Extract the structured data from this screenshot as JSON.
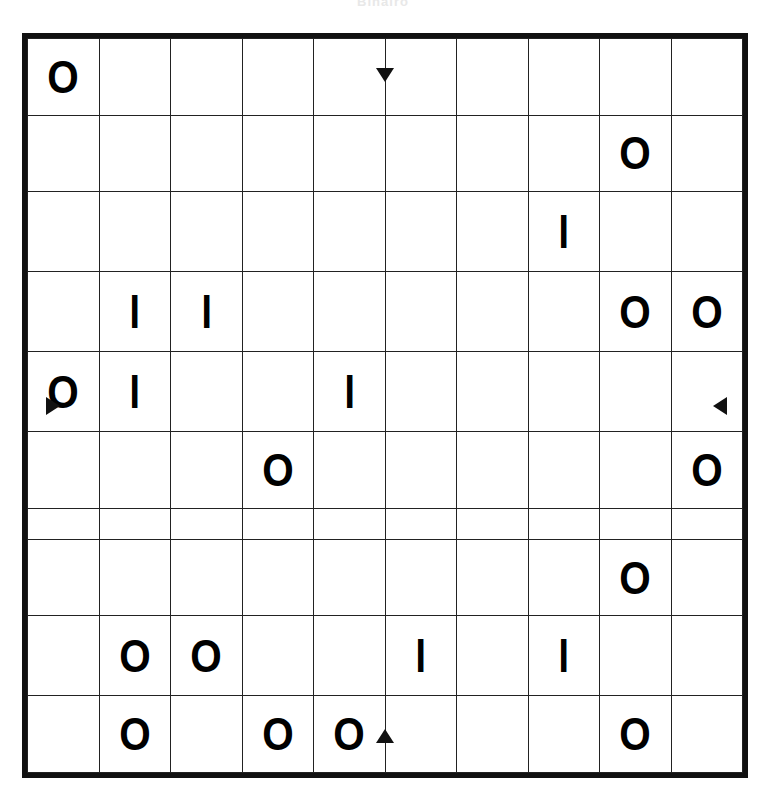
{
  "puzzle": {
    "caption": "Binairo",
    "type": "binairo-takuzu-grid",
    "rows": 10,
    "columns": 10,
    "symbols": {
      "circle": "O",
      "bar": "I",
      "empty": ""
    },
    "colors": {
      "ink": "#111111",
      "gridline": "#222222",
      "paper": "#ffffff"
    },
    "markers": {
      "top": "midpoint-tick-marker",
      "bottom": "midpoint-tick-marker",
      "left": "midpoint-tick-marker",
      "right": "midpoint-tick-marker"
    },
    "grid": [
      [
        "O",
        "",
        "",
        "",
        "",
        "",
        "",
        "",
        "",
        ""
      ],
      [
        "",
        "",
        "",
        "",
        "",
        "",
        "",
        "",
        "O",
        ""
      ],
      [
        "",
        "",
        "",
        "",
        "",
        "",
        "",
        "I",
        "",
        ""
      ],
      [
        "",
        "I",
        "I",
        "",
        "",
        "",
        "",
        "",
        "O",
        "O"
      ],
      [
        "O",
        "I",
        "",
        "",
        "I",
        "",
        "",
        "",
        "",
        ""
      ],
      [
        "",
        "",
        "",
        "O",
        "",
        "",
        "",
        "",
        "",
        "O"
      ],
      [
        "",
        "",
        "",
        "",
        "",
        "",
        "",
        "",
        "",
        ""
      ],
      [
        "",
        "",
        "",
        "",
        "",
        "",
        "",
        "",
        "O",
        ""
      ],
      [
        "",
        "O",
        "O",
        "",
        "",
        "I",
        "",
        "I",
        "",
        ""
      ],
      [
        "",
        "O",
        "",
        "O",
        "O",
        "",
        "",
        "",
        "O",
        ""
      ]
    ]
  }
}
